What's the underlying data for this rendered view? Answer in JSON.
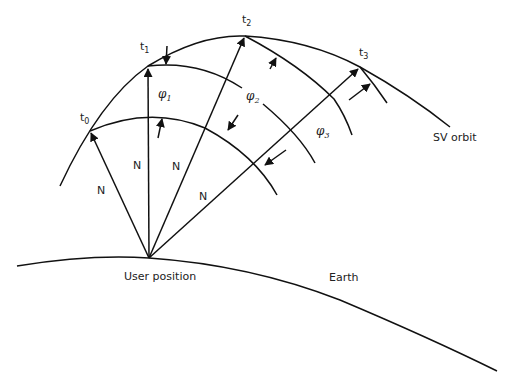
{
  "diagram": {
    "labels": {
      "t0": {
        "base": "t",
        "sub": "0"
      },
      "t1": {
        "base": "t",
        "sub": "1"
      },
      "t2": {
        "base": "t",
        "sub": "2"
      },
      "t3": {
        "base": "t",
        "sub": "3"
      },
      "phi1": {
        "base": "φ",
        "sub": "1"
      },
      "phi2": {
        "base": "φ",
        "sub": "2"
      },
      "phi3": {
        "base": "φ",
        "sub": "3"
      },
      "n_labels": [
        "N",
        "N",
        "N",
        "N"
      ],
      "sv_orbit": "SV orbit",
      "earth": "Earth",
      "user_position": "User position"
    },
    "nodes": [
      {
        "id": "user",
        "label": "User position",
        "x": 149,
        "y": 258
      },
      {
        "id": "t0",
        "label": "t0",
        "x": 90,
        "y": 131
      },
      {
        "id": "t1",
        "label": "t1",
        "x": 148,
        "y": 66
      },
      {
        "id": "t2",
        "label": "t2",
        "x": 245,
        "y": 36
      },
      {
        "id": "t3",
        "label": "t3",
        "x": 360,
        "y": 67
      }
    ],
    "edges": [
      {
        "from": "user",
        "to": "t0",
        "label": "N",
        "arrow": true
      },
      {
        "from": "user",
        "to": "t1",
        "label": "N",
        "arrow": true
      },
      {
        "from": "user",
        "to": "t2",
        "label": "N",
        "arrow": true
      },
      {
        "from": "user",
        "to": "t3",
        "label": "N",
        "arrow": true
      }
    ],
    "colors": {
      "stroke": "#111111",
      "background": "#ffffff",
      "text": "#222222"
    }
  }
}
